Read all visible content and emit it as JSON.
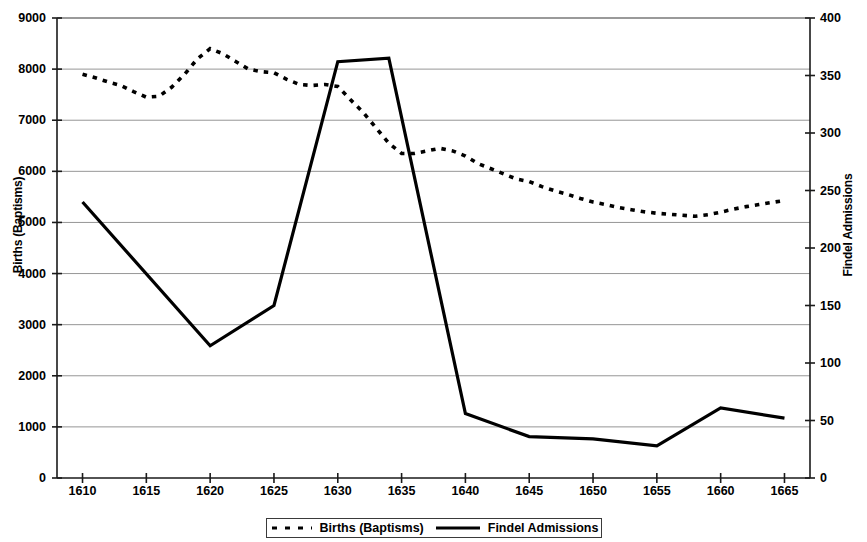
{
  "chart_data": {
    "type": "line",
    "title": "",
    "xlabel": "",
    "ylabel": "Births (Baptisms)",
    "y2label": "Findel Admissions",
    "xlim": [
      1608,
      1667
    ],
    "ylim": [
      0,
      9000
    ],
    "y2lim": [
      0,
      400
    ],
    "grid": true,
    "legend_position": "bottom",
    "x_ticks": [
      1610,
      1615,
      1620,
      1625,
      1630,
      1635,
      1640,
      1645,
      1650,
      1655,
      1660,
      1665
    ],
    "y_ticks_left": [
      0,
      1000,
      2000,
      3000,
      4000,
      5000,
      6000,
      7000,
      8000,
      9000
    ],
    "y_ticks_right": [
      0,
      50,
      100,
      150,
      200,
      250,
      300,
      350,
      400
    ],
    "series": [
      {
        "name": "Births (Baptisms)",
        "axis": "left",
        "style": "dotted",
        "color": "#000000",
        "x": [
          1610,
          1611,
          1612,
          1613,
          1614,
          1615,
          1616,
          1617,
          1618,
          1619,
          1620,
          1621,
          1622,
          1623,
          1624,
          1625,
          1626,
          1627,
          1628,
          1629,
          1630,
          1631,
          1632,
          1633,
          1634,
          1635,
          1636,
          1637,
          1638,
          1639,
          1640,
          1641,
          1642,
          1643,
          1644,
          1645,
          1646,
          1647,
          1648,
          1649,
          1650,
          1651,
          1652,
          1653,
          1654,
          1655,
          1656,
          1657,
          1658,
          1659,
          1660,
          1661,
          1662,
          1663,
          1664,
          1665
        ],
        "values": [
          7900,
          7830,
          7750,
          7680,
          7560,
          7450,
          7470,
          7650,
          7900,
          8200,
          8400,
          8300,
          8150,
          8000,
          7950,
          7930,
          7800,
          7700,
          7680,
          7700,
          7660,
          7400,
          7150,
          6850,
          6550,
          6350,
          6350,
          6400,
          6450,
          6400,
          6300,
          6150,
          6050,
          5950,
          5850,
          5800,
          5700,
          5620,
          5550,
          5470,
          5400,
          5350,
          5290,
          5250,
          5210,
          5180,
          5160,
          5140,
          5120,
          5150,
          5200,
          5260,
          5310,
          5350,
          5390,
          5430
        ]
      },
      {
        "name": "Findel Admissions",
        "axis": "right",
        "style": "solid",
        "color": "#000000",
        "x": [
          1610,
          1620,
          1625,
          1630,
          1634,
          1640,
          1645,
          1650,
          1655,
          1660,
          1665
        ],
        "values": [
          240,
          115,
          150,
          362,
          365,
          56,
          36,
          34,
          28,
          61,
          52
        ],
        "values_left_scale_equivalent": [
          5400,
          2580,
          3370,
          8140,
          8210,
          1250,
          800,
          770,
          620,
          1380,
          1180
        ]
      }
    ]
  },
  "axes": {
    "left_title": "Births (Baptisms)",
    "right_title": "Findel Admissions"
  },
  "legend": {
    "items": [
      {
        "label": "Births (Baptisms)",
        "marker": "dotted-line-marker"
      },
      {
        "label": "Findel Admissions",
        "marker": "solid-line-marker"
      }
    ]
  }
}
